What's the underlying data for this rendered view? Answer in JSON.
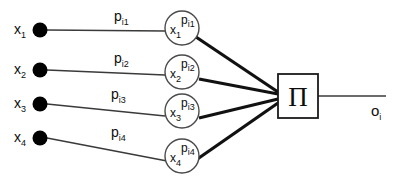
{
  "diagram": {
    "type": "neural-network-node",
    "colors": {
      "background": "#ffffff",
      "stroke": "#1a1a1a",
      "node_fill": "#ffffff",
      "input_dot_fill": "#000000",
      "text": "#0d0d0d"
    },
    "inputs": [
      {
        "label": "x",
        "subscript": "1"
      },
      {
        "label": "x",
        "subscript": "2"
      },
      {
        "label": "x",
        "subscript": "3"
      },
      {
        "label": "x",
        "subscript": "4"
      }
    ],
    "edge_labels": [
      {
        "base": "p",
        "subscript": "i1"
      },
      {
        "base": "p",
        "subscript": "i2"
      },
      {
        "base": "p",
        "subscript": "i3"
      },
      {
        "base": "p",
        "subscript": "i4"
      }
    ],
    "power_nodes": [
      {
        "base": "x",
        "subscript": "1",
        "exponent_base": "p",
        "exponent_subscript": "i1"
      },
      {
        "base": "x",
        "subscript": "2",
        "exponent_base": "p",
        "exponent_subscript": "i2"
      },
      {
        "base": "x",
        "subscript": "3",
        "exponent_base": "p",
        "exponent_subscript": "i3"
      },
      {
        "base": "x",
        "subscript": "4",
        "exponent_base": "p",
        "exponent_subscript": "i4"
      }
    ],
    "aggregator": {
      "symbol": "Π",
      "name": "product-operator"
    },
    "output": {
      "base": "o",
      "subscript": "i"
    }
  }
}
